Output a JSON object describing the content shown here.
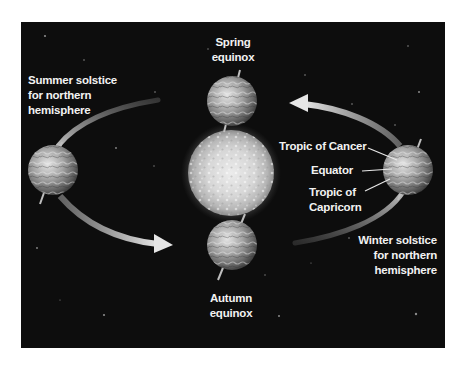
{
  "diagram": {
    "type": "earth-orbit-seasons",
    "colors": {
      "background": "#ffffff",
      "space": "#0d0d0d",
      "label": "#f2f2f2",
      "orbit_arrow": "#bdbdbd",
      "sun_core": "#e6e6e6",
      "sun_edge": "#9a9a9a",
      "earth_light": "#e0e0e0",
      "earth_dark": "#4a4a4a"
    },
    "central_body": {
      "name": "Sun"
    },
    "positions": [
      {
        "id": "spring",
        "line1": "Spring",
        "line2": "equinox"
      },
      {
        "id": "summer",
        "line1": "Summer solstice",
        "line2": "for northern",
        "line3": "hemisphere"
      },
      {
        "id": "autumn",
        "line1": "Autumn",
        "line2": "equinox"
      },
      {
        "id": "winter",
        "line1": "Winter solstice",
        "line2": "for northern",
        "line3": "hemisphere"
      }
    ],
    "latitude_labels": {
      "tropic_cancer": "Tropic of Cancer",
      "equator": "Equator",
      "tropic_capricorn_line1": "Tropic of",
      "tropic_capricorn_line2": "Capricorn"
    },
    "orbit_direction": "counterclockwise"
  }
}
